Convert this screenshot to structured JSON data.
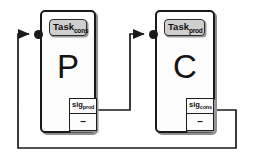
{
  "diagram": {
    "type": "component-diagram",
    "colors": {
      "line": "#1a1a1a",
      "component_fill": "#fdfdfd",
      "component_border": "#1a1a1a",
      "task_port_fill": "#cfcfcf",
      "signal_fill": "#fcfcfc",
      "shadow": "#8f8f8f"
    },
    "components": [
      {
        "id": "producer",
        "letter": "P",
        "task_port": {
          "name": "Task",
          "subscript": "cons"
        },
        "signal_port": {
          "name": "sig",
          "subscript": "prod",
          "value": "–"
        }
      },
      {
        "id": "consumer",
        "letter": "C",
        "task_port": {
          "name": "Task",
          "subscript": "prod"
        },
        "signal_port": {
          "name": "sig",
          "subscript": "cons",
          "value": "–"
        }
      }
    ],
    "connections": [
      {
        "id": "sig-prod-to-task-prod",
        "from": "producer.sig_prod",
        "to": "consumer.Task_prod"
      },
      {
        "id": "sig-cons-to-task-cons",
        "from": "consumer.sig_cons",
        "to": "producer.Task_cons"
      }
    ]
  }
}
